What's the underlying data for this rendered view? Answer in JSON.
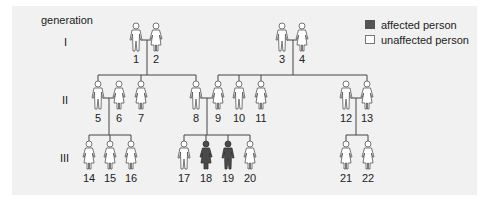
{
  "title": "generation",
  "generations": [
    {
      "label": "I",
      "y": 42
    },
    {
      "label": "II",
      "y": 100
    },
    {
      "label": "III",
      "y": 158
    }
  ],
  "legend": {
    "affected": {
      "label": "affected person",
      "color": "#555555"
    },
    "unaffected": {
      "label": "unaffected person",
      "color": "#ffffff"
    }
  },
  "colors": {
    "line": "#444444",
    "affected_fill": "#4a4a4a",
    "unaffected_fill": "#ffffff",
    "outline": "#555555"
  },
  "people": [
    {
      "id": "1",
      "sex": "male",
      "affected": false,
      "generation": "I",
      "x": 136
    },
    {
      "id": "2",
      "sex": "female",
      "affected": false,
      "generation": "I",
      "x": 156
    },
    {
      "id": "3",
      "sex": "male",
      "affected": false,
      "generation": "I",
      "x": 282
    },
    {
      "id": "4",
      "sex": "female",
      "affected": false,
      "generation": "I",
      "x": 302
    },
    {
      "id": "5",
      "sex": "male",
      "affected": false,
      "generation": "II",
      "x": 98
    },
    {
      "id": "6",
      "sex": "female",
      "affected": false,
      "generation": "II",
      "x": 119
    },
    {
      "id": "7",
      "sex": "female",
      "affected": false,
      "generation": "II",
      "x": 141
    },
    {
      "id": "8",
      "sex": "male",
      "affected": false,
      "generation": "II",
      "x": 196
    },
    {
      "id": "9",
      "sex": "female",
      "affected": false,
      "generation": "II",
      "x": 218
    },
    {
      "id": "10",
      "sex": "male",
      "affected": false,
      "generation": "II",
      "x": 239
    },
    {
      "id": "11",
      "sex": "female",
      "affected": false,
      "generation": "II",
      "x": 261
    },
    {
      "id": "12",
      "sex": "male",
      "affected": false,
      "generation": "II",
      "x": 346
    },
    {
      "id": "13",
      "sex": "female",
      "affected": false,
      "generation": "II",
      "x": 367
    },
    {
      "id": "14",
      "sex": "female",
      "affected": false,
      "generation": "III",
      "x": 89
    },
    {
      "id": "15",
      "sex": "female",
      "affected": false,
      "generation": "III",
      "x": 110
    },
    {
      "id": "16",
      "sex": "female",
      "affected": false,
      "generation": "III",
      "x": 131
    },
    {
      "id": "17",
      "sex": "male",
      "affected": false,
      "generation": "III",
      "x": 184
    },
    {
      "id": "18",
      "sex": "female",
      "affected": true,
      "generation": "III",
      "x": 206
    },
    {
      "id": "19",
      "sex": "male",
      "affected": true,
      "generation": "III",
      "x": 228
    },
    {
      "id": "20",
      "sex": "female",
      "affected": false,
      "generation": "III",
      "x": 250
    },
    {
      "id": "21",
      "sex": "female",
      "affected": false,
      "generation": "III",
      "x": 346
    },
    {
      "id": "22",
      "sex": "female",
      "affected": false,
      "generation": "III",
      "x": 368
    }
  ],
  "couples": [
    {
      "partners": [
        "1",
        "2"
      ],
      "children": [
        "5",
        "7",
        "8"
      ]
    },
    {
      "partners": [
        "3",
        "4"
      ],
      "children": [
        "9",
        "10",
        "11",
        "13"
      ]
    },
    {
      "partners": [
        "5",
        "6"
      ],
      "children": [
        "14",
        "15",
        "16"
      ]
    },
    {
      "partners": [
        "8",
        "9"
      ],
      "children": [
        "17",
        "18",
        "19",
        "20"
      ]
    },
    {
      "partners": [
        "12",
        "13"
      ],
      "children": [
        "21",
        "22"
      ]
    }
  ]
}
